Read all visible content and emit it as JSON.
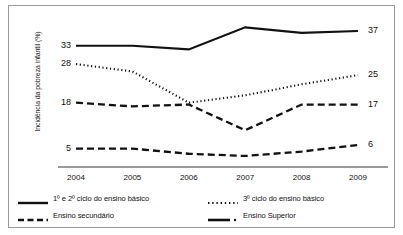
{
  "chart_data": {
    "type": "line",
    "title": "",
    "xlabel": "",
    "ylabel": "Incidência da pobreza infantil (%)",
    "categories": [
      "2004",
      "2005",
      "2006",
      "2007",
      "2008",
      "2009"
    ],
    "ylim": [
      0,
      40
    ],
    "grid": false,
    "legend_position": "bottom",
    "series": [
      {
        "name": "1º e 2º ciclo do ensino básico",
        "style": "solid",
        "values": [
          33,
          33,
          32,
          38,
          36.5,
          37
        ],
        "start_label": "33",
        "end_label": "37"
      },
      {
        "name": "3º ciclo do ensino básico",
        "style": "dotted",
        "values": [
          28,
          26,
          17.5,
          19.5,
          22.5,
          25
        ],
        "start_label": "28",
        "end_label": "25"
      },
      {
        "name": "Ensino secundário",
        "style": "dashed",
        "values": [
          17.5,
          16.5,
          17,
          10,
          17,
          17
        ],
        "start_label": "18",
        "end_label": "17"
      },
      {
        "name": "Ensino Superior",
        "style": "dashdot",
        "values": [
          5,
          5,
          3.6,
          3,
          4.2,
          6
        ],
        "start_label": "5",
        "end_label": "6"
      }
    ],
    "left_value_labels": [
      "33",
      "28",
      "18",
      "5"
    ],
    "right_value_labels": [
      "37",
      "25",
      "17",
      "6"
    ]
  },
  "axis": {
    "y_title": "Incidência da pobreza infantil (%)",
    "x_ticks": [
      "2004",
      "2005",
      "2006",
      "2007",
      "2008",
      "2009"
    ]
  },
  "legend": {
    "items": [
      {
        "label": "1º e 2º ciclo do ensino básico",
        "style": "solid"
      },
      {
        "label": "3º ciclo do ensino básico",
        "style": "dotted"
      },
      {
        "label": "Ensino secundário",
        "style": "dashed"
      },
      {
        "label": "Ensino Superior",
        "style": "dashdot"
      }
    ]
  },
  "colors": {
    "ink": "#111111",
    "frame": "#9a9a9a",
    "axis": "#7a7a7a",
    "background": "#ffffff"
  }
}
